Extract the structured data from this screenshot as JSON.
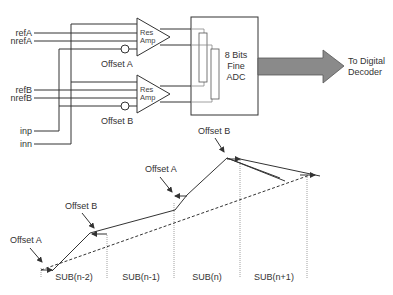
{
  "circuit": {
    "inputs": [
      "refA",
      "nrefA",
      "refB",
      "nrefB",
      "inp",
      "inn"
    ],
    "amp_a": {
      "line1": "Res",
      "line2": "Amp",
      "offset_label": "Offset A"
    },
    "amp_b": {
      "line1": "Res",
      "line2": "Amp",
      "offset_label": "Offset B"
    },
    "adc": {
      "line1": "8 Bits",
      "line2": "Fine",
      "line3": "ADC"
    },
    "output": {
      "line1": "To Digital",
      "line2": "Decoder"
    },
    "colors": {
      "arrow_fill": "#8a8a8a",
      "line": "#333333"
    }
  },
  "transfer": {
    "annotations": [
      "Offset A",
      "Offset B",
      "Offset A",
      "Offset B"
    ],
    "segments": [
      "SUB(n-2)",
      "SUB(n-1)",
      "SUB(n)",
      "SUB(n+1)"
    ]
  }
}
